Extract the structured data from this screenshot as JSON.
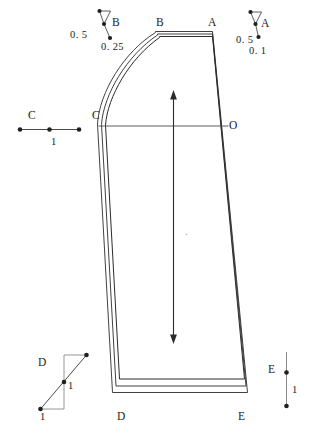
{
  "drawing": {
    "title": "Trouser / skirt pattern block with notch markers",
    "stroke_color": "#2b2b2b",
    "marker_color": "#4a4a4a",
    "background": "#ffffff",
    "width": 310,
    "height": 434
  },
  "main_piece": {
    "name": "pattern-outline",
    "points": {
      "A": "A",
      "B": "B",
      "C": "C",
      "D": "D",
      "E": "E",
      "O": "O"
    },
    "grainline": "double-arrow-grainline",
    "seam_allowance_lines": 3,
    "hem_lines": 3
  },
  "markers": {
    "B": {
      "label": "B",
      "dim_left": "0. 5",
      "dim_bottom": "0. 25"
    },
    "A": {
      "label": "A",
      "dim_left": "0. 5",
      "dim_bottom": "0. 1"
    },
    "C": {
      "label": "C",
      "dim_bottom": "1"
    },
    "D": {
      "label": "D",
      "dim_right": "1",
      "dim_bottom": "1"
    },
    "E": {
      "label": "E",
      "dim_right": "1"
    }
  }
}
